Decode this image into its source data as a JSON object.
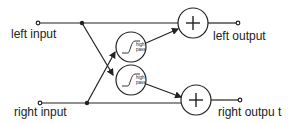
{
  "diagram": {
    "labels": {
      "left_input": "left input",
      "right_input": "right input",
      "left_output": "left output",
      "right_output": "right outpu t"
    },
    "filters": [
      {
        "text_line1": "high",
        "text_line2": "pass"
      },
      {
        "text_line1": "high",
        "text_line2": "pass"
      }
    ],
    "summers": [
      {
        "symbol": "+"
      },
      {
        "symbol": "+"
      }
    ],
    "colors": {
      "stroke": "#222222",
      "background": "#ffffff"
    }
  }
}
